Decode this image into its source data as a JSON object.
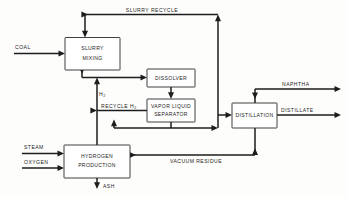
{
  "diagram": {
    "stroke_color": "#1d1d1d",
    "background_color": "#fdfdfc",
    "units": [
      {
        "id": "slurry-mixing",
        "line1": "SLURRY",
        "line2": "MIXING"
      },
      {
        "id": "dissolver",
        "line1": "DISSOLVER",
        "line2": ""
      },
      {
        "id": "vapor-liquid-separator",
        "line1": "VAPOR LIQUID",
        "line2": "SEPARATOR"
      },
      {
        "id": "distillation",
        "line1": "DISTILLATION",
        "line2": ""
      },
      {
        "id": "hydrogen-production",
        "line1": "HYDROGEN",
        "line2": "PRODUCTION"
      }
    ],
    "streams": {
      "coal": "COAL",
      "steam": "STEAM",
      "oxygen": "OXYGEN",
      "ash": "ASH",
      "naphtha": "NAPHTHA",
      "distillate": "DISTILLATE",
      "slurry_recycle": "SLURRY RECYCLE",
      "vacuum_residue": "VACUUM RESIDUE",
      "recycle_h2": "RECYCLE H",
      "recycle_h2_sub": "2",
      "h2": "H",
      "h2_sub": "2"
    }
  }
}
